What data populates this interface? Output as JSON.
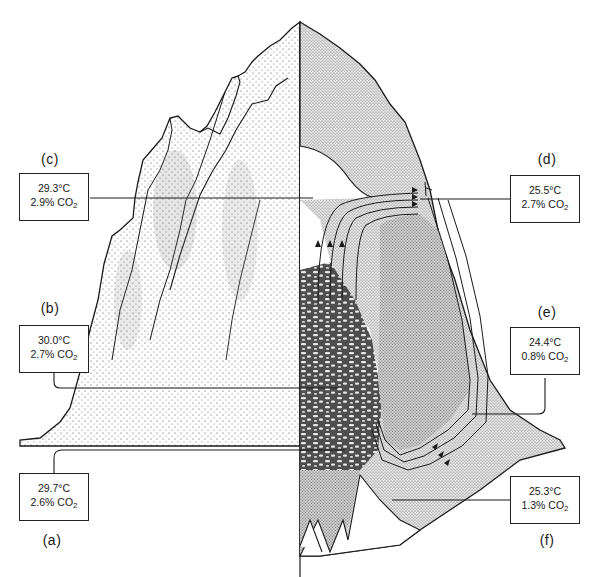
{
  "figure": {
    "colors": {
      "ink": "#1a1a1a",
      "stipple_light": "#d6d6d6",
      "stipple_mid": "#bdbdbd",
      "fungus_dark": "#5a5a5a",
      "background": "#ffffff"
    }
  },
  "readings": [
    {
      "label": "(a)",
      "temperature": "29.7°C",
      "co2_value": "2.6% CO",
      "co2_sub": "2"
    },
    {
      "label": "(b)",
      "temperature": "30.0°C",
      "co2_value": "2.7% CO",
      "co2_sub": "2"
    },
    {
      "label": "(c)",
      "temperature": "29.3°C",
      "co2_value": "2.9% CO",
      "co2_sub": "2"
    },
    {
      "label": "(d)",
      "temperature": "25.5°C",
      "co2_value": "2.7% CO",
      "co2_sub": "2"
    },
    {
      "label": "(e)",
      "temperature": "24.4°C",
      "co2_value": "0.8% CO",
      "co2_sub": "2"
    },
    {
      "label": "(f)",
      "temperature": "25.3°C",
      "co2_value": "1.3% CO",
      "co2_sub": "2"
    }
  ]
}
